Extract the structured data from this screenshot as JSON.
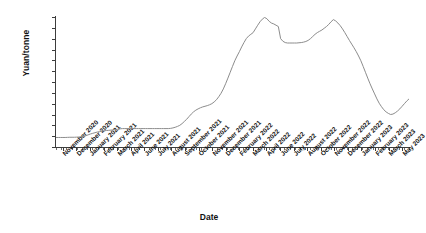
{
  "chart_data": {
    "type": "line",
    "title": "",
    "xlabel": "Date",
    "ylabel": "Yuan/tonne",
    "ylim": [
      0,
      600000
    ],
    "ytick_values": [
      0,
      50000,
      100000,
      150000,
      200000,
      250000,
      300000,
      350000,
      400000,
      450000,
      500000,
      550000,
      600000
    ],
    "ytick_labels": [
      "0",
      "50,000",
      "100,000",
      "150,000",
      "200,000",
      "250,000",
      "300,000",
      "350,000",
      "400,000",
      "450,000",
      "500,000",
      "550,000",
      "600,000"
    ],
    "grid": true,
    "legend": "none",
    "line_color": "#8c8c8c",
    "xtick_labels": [
      "November 2020",
      "December 2020",
      "January 2021",
      "February 2021",
      "March 2021",
      "April 2021",
      "June 2021",
      "July 2021",
      "August 2021",
      "September 2021",
      "October 2021",
      "November 2021",
      "December 2021",
      "February 2022",
      "March 2022",
      "April 2022",
      "June 2022",
      "July 2022",
      "August 2022",
      "October 2022",
      "November 2022",
      "December 2022",
      "January 2023",
      "February 2023",
      "March 2023",
      "May 2023"
    ],
    "x_index": [
      0,
      1,
      2,
      3,
      4,
      5,
      6,
      7,
      8,
      9,
      10,
      11,
      12,
      13,
      14,
      15,
      16,
      17,
      18,
      19,
      20,
      21,
      22,
      23,
      24,
      25,
      26,
      27,
      28,
      29,
      30,
      31,
      32,
      33,
      34,
      35,
      36,
      37,
      38,
      39,
      40,
      41,
      42,
      43,
      44,
      45,
      46,
      47,
      48,
      49,
      50,
      51,
      52,
      53,
      54,
      55,
      56,
      57,
      58,
      59,
      60,
      61,
      62,
      63,
      64,
      65,
      66,
      67,
      68,
      69,
      70,
      71,
      72,
      73,
      74,
      75,
      76,
      77,
      78,
      79,
      80,
      81,
      82,
      83,
      84,
      85,
      86,
      87,
      88,
      89,
      90,
      91,
      92,
      93,
      94,
      95,
      96,
      97,
      98,
      99,
      100,
      101,
      102,
      103,
      104,
      105,
      106,
      107,
      108,
      109,
      110,
      111,
      112,
      113,
      114,
      115,
      116,
      117,
      118,
      119,
      120,
      121,
      122,
      123,
      124,
      125,
      126,
      127,
      128,
      129,
      130
    ],
    "values": [
      44000,
      44000,
      44000,
      44000,
      44000,
      44500,
      45000,
      45000,
      45000,
      45500,
      46000,
      47000,
      49000,
      52000,
      56000,
      60000,
      63000,
      66000,
      69000,
      71000,
      73000,
      75000,
      76000,
      77000,
      78000,
      79000,
      80000,
      82000,
      84000,
      85000,
      85000,
      85000,
      85000,
      85000,
      85000,
      85000,
      85000,
      85000,
      85000,
      85000,
      85000,
      85000,
      85000,
      85000,
      85000,
      85000,
      85000,
      85000,
      85000,
      85000,
      86000,
      88000,
      91000,
      95000,
      100000,
      108000,
      118000,
      128000,
      140000,
      152000,
      162000,
      170000,
      176000,
      181000,
      185000,
      188000,
      191000,
      195000,
      200000,
      208000,
      218000,
      232000,
      248000,
      268000,
      292000,
      318000,
      345000,
      372000,
      398000,
      420000,
      440000,
      462000,
      482000,
      500000,
      512000,
      520000,
      528000,
      545000,
      562000,
      578000,
      590000,
      598000,
      592000,
      580000,
      572000,
      568000,
      562000,
      556000,
      500000,
      488000,
      482000,
      480000,
      480000,
      480000,
      480000,
      480000,
      481000,
      482000,
      484000,
      487000,
      492000,
      500000,
      510000,
      520000,
      528000,
      534000,
      540000,
      548000,
      556000,
      566000,
      578000,
      588000,
      582000,
      572000,
      560000,
      545000,
      528000,
      510000,
      492000,
      475000,
      458000
    ],
    "values_tail": [
      440000,
      420000,
      398000,
      372000,
      345000,
      318000,
      292000,
      268000,
      245000,
      222000,
      202000,
      186000,
      172000,
      162000,
      155000,
      150000,
      152000,
      158000,
      166000,
      176000,
      188000,
      200000,
      212000,
      222000
    ],
    "peak_first": 600000,
    "peak_second": 590000,
    "trough_end": 150000,
    "start_value": 44000
  }
}
